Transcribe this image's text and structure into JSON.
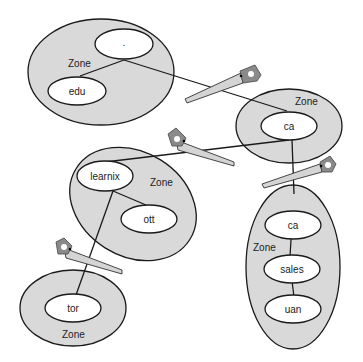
{
  "diagram": {
    "zone_label": "Zone",
    "zones": [
      {
        "id": "root-zone",
        "label": "Zone",
        "nodes": [
          ".",
          "edu"
        ]
      },
      {
        "id": "ca-zone",
        "label": "Zone",
        "nodes": [
          "ca"
        ]
      },
      {
        "id": "learnix-zone",
        "label": "Zone",
        "nodes": [
          "learnix",
          "ott"
        ]
      },
      {
        "id": "ca-sales-zone",
        "label": "Zone",
        "nodes": [
          "ca",
          "sales",
          "uan"
        ]
      },
      {
        "id": "tor-zone",
        "label": "Zone",
        "nodes": [
          "tor"
        ]
      }
    ],
    "nodes": {
      "root": ".",
      "edu": "edu",
      "ca_top": "ca",
      "learnix": "learnix",
      "ott": "ott",
      "ca_sub": "ca",
      "sales": "sales",
      "uan": "uan",
      "tor": "tor"
    },
    "cut_icon": "saw-icon",
    "colors": {
      "zone_fill": "#d9d9d9",
      "node_fill": "#ffffff",
      "stroke": "#1a1a1a"
    }
  }
}
